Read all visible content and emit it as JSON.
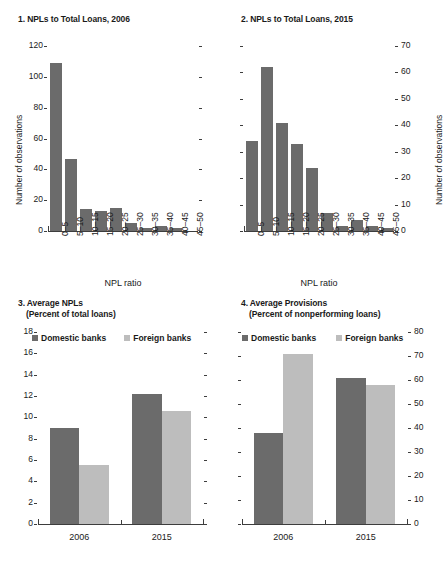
{
  "chart_data": [
    {
      "id": "panel1",
      "type": "bar",
      "title": "1. NPLs to Total Loans, 2006",
      "xlabel": "NPL ratio",
      "ylabel": "Number of observations",
      "categories": [
        "0–5",
        "5–10",
        "10–15",
        "15–20",
        "20–25",
        "25–30",
        "30–35",
        "35–40",
        "40–45",
        "45–50"
      ],
      "values": [
        109,
        47,
        14,
        13,
        15,
        5,
        2,
        3,
        2,
        0
      ],
      "ylim": [
        0,
        120
      ],
      "yticks": [
        0,
        20,
        40,
        60,
        80,
        100,
        120
      ],
      "ytick_labels": [
        "0",
        "20",
        "40",
        "60",
        "80",
        "100",
        "120"
      ],
      "right_ticks_unlabeled": true,
      "grid": false,
      "series_color": "#6b6b6b"
    },
    {
      "id": "panel2",
      "type": "bar",
      "title": "2. NPLs to Total Loans, 2015",
      "xlabel": "NPL ratio",
      "ylabel": "Number of observations",
      "categories": [
        "0–5",
        "5–10",
        "10–15",
        "15–20",
        "20–25",
        "25–30",
        "30–35",
        "35–40",
        "40–45",
        "45–50"
      ],
      "values": [
        34,
        62,
        41,
        33,
        24,
        7,
        2,
        4,
        2,
        1
      ],
      "ylim": [
        0,
        70
      ],
      "yticks": [
        0,
        10,
        20,
        30,
        40,
        50,
        60,
        70
      ],
      "ytick_labels": [
        "0",
        "10",
        "20",
        "30",
        "40",
        "50",
        "60",
        "70"
      ],
      "axis_position": "right",
      "left_ticks_unlabeled": true,
      "grid": false,
      "series_color": "#6b6b6b"
    },
    {
      "id": "panel3",
      "type": "bar",
      "title": "3. Average NPLs\n     (Percent of total loans)",
      "title_line1": "3. Average NPLs",
      "title_line2": "(Percent of total loans)",
      "xlabel": "",
      "ylabel": "",
      "categories": [
        "2006",
        "2015"
      ],
      "series": [
        {
          "name": "Domestic banks",
          "color": "#6b6b6b",
          "values": [
            9.0,
            12.2
          ]
        },
        {
          "name": "Foreign banks",
          "color": "#bdbdbd",
          "values": [
            5.5,
            10.6
          ]
        }
      ],
      "ylim": [
        0,
        18
      ],
      "yticks": [
        0,
        2,
        4,
        6,
        8,
        10,
        12,
        14,
        16,
        18
      ],
      "ytick_labels": [
        "0",
        "2",
        "4",
        "6",
        "8",
        "10",
        "12",
        "14",
        "16",
        "18"
      ],
      "legend_position": "top",
      "grid": false
    },
    {
      "id": "panel4",
      "type": "bar",
      "title": "4. Average Provisions\n     (Percent of nonperforming loans)",
      "title_line1": "4. Average Provisions",
      "title_line2": "(Percent of nonperforming loans)",
      "xlabel": "",
      "ylabel": "",
      "categories": [
        "2006",
        "2015"
      ],
      "series": [
        {
          "name": "Domestic banks",
          "color": "#6b6b6b",
          "values": [
            38,
            61
          ]
        },
        {
          "name": "Foreign banks",
          "color": "#bdbdbd",
          "values": [
            71,
            58
          ]
        }
      ],
      "ylim": [
        0,
        80
      ],
      "yticks": [
        0,
        10,
        20,
        30,
        40,
        50,
        60,
        70,
        80
      ],
      "ytick_labels": [
        "0",
        "10",
        "20",
        "30",
        "40",
        "50",
        "60",
        "70",
        "80"
      ],
      "axis_position": "right",
      "left_ticks_unlabeled": true,
      "legend_position": "top",
      "grid": false
    }
  ],
  "panel1": {
    "title": "1. NPLs to Total Loans, 2006",
    "ylabel": "Number of observations",
    "xlabel": "NPL ratio",
    "ytick_labels": [
      "0",
      "20",
      "40",
      "60",
      "80",
      "100",
      "120"
    ],
    "categories": [
      "0–5",
      "5–10",
      "10–15",
      "15–20",
      "20–25",
      "25–30",
      "30–35",
      "35–40",
      "40–45",
      "45–50"
    ]
  },
  "panel2": {
    "title": "2. NPLs to Total Loans, 2015",
    "ylabel": "Number of observations",
    "xlabel": "NPL ratio",
    "ytick_labels": [
      "0",
      "10",
      "20",
      "30",
      "40",
      "50",
      "60",
      "70"
    ],
    "categories": [
      "0–5",
      "5–10",
      "10–15",
      "15–20",
      "20–25",
      "25–30",
      "30–35",
      "35–40",
      "40–45",
      "45–50"
    ]
  },
  "panel3": {
    "title_line1": "3. Average NPLs",
    "title_line2": "(Percent of total loans)",
    "ytick_labels": [
      "0",
      "2",
      "4",
      "6",
      "8",
      "10",
      "12",
      "14",
      "16",
      "18"
    ],
    "categories": [
      "2006",
      "2015"
    ],
    "legend": [
      "Domestic banks",
      "Foreign banks"
    ]
  },
  "panel4": {
    "title_line1": "4. Average Provisions",
    "title_line2": "(Percent of nonperforming loans)",
    "ytick_labels": [
      "0",
      "10",
      "20",
      "30",
      "40",
      "50",
      "60",
      "70",
      "80"
    ],
    "categories": [
      "2006",
      "2015"
    ],
    "legend": [
      "Domestic banks",
      "Foreign banks"
    ]
  },
  "colors": {
    "domestic": "#6b6b6b",
    "foreign": "#bdbdbd",
    "axis": "#3d3d3d",
    "text": "#1a1a1a",
    "background": "#ffffff"
  }
}
